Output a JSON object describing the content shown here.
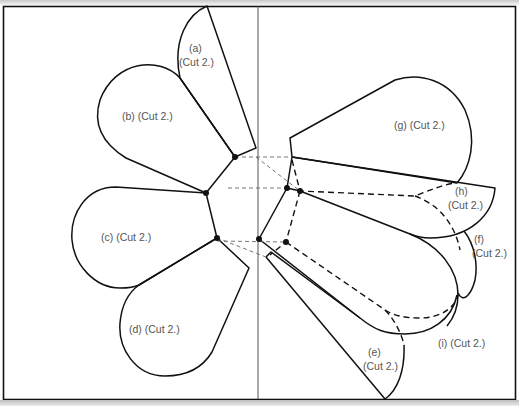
{
  "diagram": {
    "type": "sewing-pattern",
    "colors": {
      "outline": "#111111",
      "divider": "#555555",
      "label": "#555555",
      "background": "#ffffff"
    },
    "pieces": [
      {
        "id": "a",
        "label_line1": "(a)",
        "label_line2": "(Cut 2.)"
      },
      {
        "id": "b",
        "label_line1": "(b) (Cut 2.)"
      },
      {
        "id": "c",
        "label_line1": "(c) (Cut 2.)"
      },
      {
        "id": "d",
        "label_line1": "(d) (Cut 2.)"
      },
      {
        "id": "e",
        "label_line1": "(e)",
        "label_line2": "(Cut 2.)"
      },
      {
        "id": "f",
        "label_line1": "(f)",
        "label_line2": "(Cut 2.)"
      },
      {
        "id": "g",
        "label_line1": "(g) (Cut 2.)"
      },
      {
        "id": "h",
        "label_line1": "(h)",
        "label_line2": "(Cut 2.)"
      },
      {
        "id": "i",
        "label_line1": "(i) (Cut 2.)"
      }
    ]
  }
}
